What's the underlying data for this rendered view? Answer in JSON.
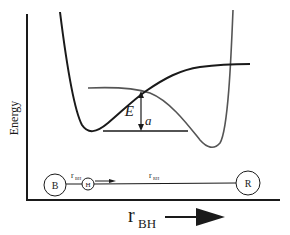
{
  "diagram": {
    "type": "potential-energy-diagram",
    "y_axis_label": "Energy",
    "x_axis_label_main": "r",
    "x_axis_label_sub": "BH",
    "activation_energy_label_main": "E",
    "activation_energy_label_sub": "a",
    "curves": [
      {
        "name": "B-H potential",
        "color": "#1a1a1a"
      },
      {
        "name": "H-R potential",
        "color": "#555555"
      }
    ],
    "molecule": {
      "atoms": [
        {
          "label": "B"
        },
        {
          "label": "H"
        },
        {
          "label": "R"
        }
      ],
      "bond_label_1_main": "r",
      "bond_label_1_sub": "BH",
      "bond_label_2_main": "r",
      "bond_label_2_sub": "RH"
    },
    "colors": {
      "ink": "#1a1a1a",
      "gray_curve": "#555555",
      "background": "#ffffff"
    }
  }
}
